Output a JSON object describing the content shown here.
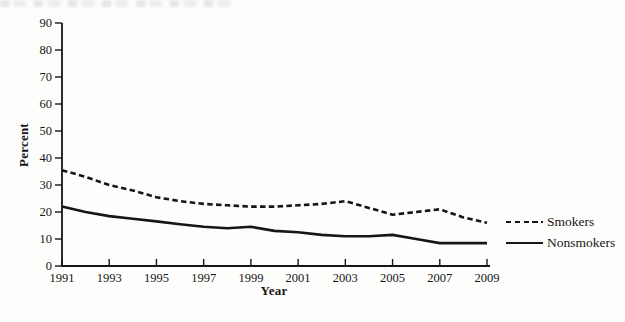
{
  "figure": {
    "background": "#fdfdfc",
    "ink_color": "#161616"
  },
  "chart_data": {
    "type": "line",
    "title": "",
    "xlabel": "Year",
    "ylabel": "Percent",
    "x": [
      1991,
      1992,
      1993,
      1994,
      1995,
      1996,
      1997,
      1998,
      1999,
      2000,
      2001,
      2002,
      2003,
      2004,
      2005,
      2006,
      2007,
      2008,
      2009
    ],
    "xticks": [
      1991,
      1993,
      1995,
      1997,
      1999,
      2001,
      2003,
      2005,
      2007,
      2009
    ],
    "yticks": [
      0,
      10,
      20,
      30,
      40,
      50,
      60,
      70,
      80,
      90
    ],
    "ylim": [
      0,
      90
    ],
    "xlim": [
      1991,
      2009
    ],
    "grid": false,
    "legend_position": "right-outside",
    "series": [
      {
        "name": "Smokers",
        "line_style": "dashed",
        "color": "#161616",
        "values": [
          35.5,
          33,
          30,
          28,
          25.5,
          24,
          23,
          22.5,
          22,
          22,
          22.5,
          23,
          24,
          21.5,
          19,
          20,
          21,
          18,
          16
        ]
      },
      {
        "name": "Nonsmokers",
        "line_style": "solid",
        "color": "#161616",
        "values": [
          22,
          20,
          18.5,
          17.5,
          16.5,
          15.5,
          14.5,
          14,
          14.5,
          13,
          12.5,
          11.5,
          11,
          11,
          11.5,
          10,
          8.5,
          8.5,
          8.5
        ]
      }
    ]
  }
}
